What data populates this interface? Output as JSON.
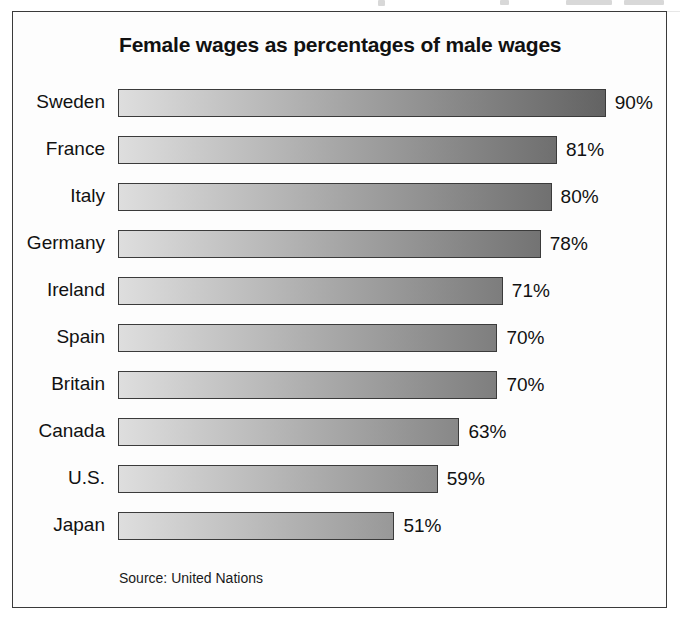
{
  "chart_data": {
    "type": "bar",
    "orientation": "horizontal",
    "title": "Female wages as percentages of male wages",
    "source": "Source: United Nations",
    "xlabel": "",
    "ylabel": "",
    "unit": "%",
    "xlim": [
      0,
      100
    ],
    "grid": false,
    "legend": null,
    "categories": [
      "Sweden",
      "France",
      "Italy",
      "Germany",
      "Ireland",
      "Spain",
      "Britain",
      "Canada",
      "U.S.",
      "Japan"
    ],
    "values": [
      90,
      81,
      80,
      78,
      71,
      70,
      70,
      63,
      59,
      51
    ],
    "value_labels": [
      "90%",
      "81%",
      "80%",
      "78%",
      "71%",
      "70%",
      "70%",
      "63%",
      "59%",
      "51%"
    ],
    "bars": [
      {
        "label": "Sweden",
        "value": 90,
        "value_label": "90%"
      },
      {
        "label": "France",
        "value": 81,
        "value_label": "81%"
      },
      {
        "label": "Italy",
        "value": 80,
        "value_label": "80%"
      },
      {
        "label": "Germany",
        "value": 78,
        "value_label": "78%"
      },
      {
        "label": "Ireland",
        "value": 71,
        "value_label": "71%"
      },
      {
        "label": "Spain",
        "value": 70,
        "value_label": "70%"
      },
      {
        "label": "Britain",
        "value": 70,
        "value_label": "70%"
      },
      {
        "label": "Canada",
        "value": 63,
        "value_label": "63%"
      },
      {
        "label": "U.S.",
        "value": 59,
        "value_label": "59%"
      },
      {
        "label": "Japan",
        "value": 51,
        "value_label": "51%"
      }
    ],
    "style": {
      "bar_gradient_start": "#dedede",
      "bar_gradient_end": "#555555",
      "bar_border": "#3b3b3b",
      "frame_border": "#3a3a3a",
      "background": "#fdfdfd",
      "text": "#111111"
    }
  }
}
